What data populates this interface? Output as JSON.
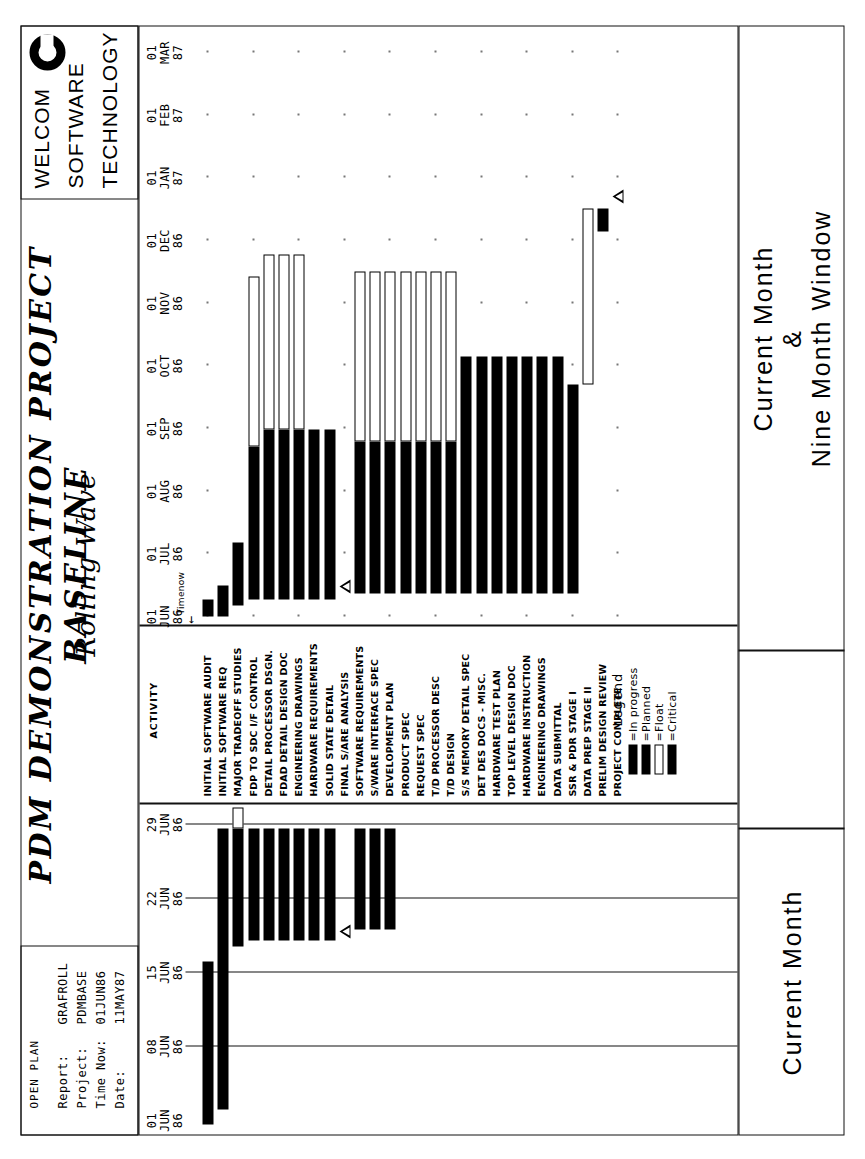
{
  "header": {
    "open_plan": "OPEN PLAN",
    "fields": [
      {
        "label": "Report:",
        "value": "GRAFROLL"
      },
      {
        "label": "Project:",
        "value": "PDMBASE"
      },
      {
        "label": "Time Now:",
        "value": "01JUN86"
      },
      {
        "label": "Date:",
        "value": "11MAY87"
      }
    ],
    "title": "PDM DEMONSTRATION PROJECT BASELINE",
    "subtitle": "Rolling Wave",
    "logo": [
      "WELCOM",
      "SOFTWARE",
      "TECHNOLOGY"
    ]
  },
  "left_scale": {
    "ticks": [
      {
        "day": "01",
        "mon": "JUN",
        "yr": "86"
      },
      {
        "day": "08",
        "mon": "JUN",
        "yr": "86"
      },
      {
        "day": "15",
        "mon": "JUN",
        "yr": "86"
      },
      {
        "day": "22",
        "mon": "JUN",
        "yr": "86"
      },
      {
        "day": "29",
        "mon": "JUN",
        "yr": "86"
      }
    ]
  },
  "right_scale": {
    "ticks": [
      {
        "day": "01",
        "mon": "JUN",
        "yr": "86"
      },
      {
        "day": "01",
        "mon": "JUL",
        "yr": "86"
      },
      {
        "day": "01",
        "mon": "AUG",
        "yr": "86"
      },
      {
        "day": "01",
        "mon": "SEP",
        "yr": "86"
      },
      {
        "day": "01",
        "mon": "OCT",
        "yr": "86"
      },
      {
        "day": "01",
        "mon": "NOV",
        "yr": "86"
      },
      {
        "day": "01",
        "mon": "DEC",
        "yr": "86"
      },
      {
        "day": "01",
        "mon": "JAN",
        "yr": "87"
      },
      {
        "day": "01",
        "mon": "FEB",
        "yr": "87"
      },
      {
        "day": "01",
        "mon": "MAR",
        "yr": "87"
      }
    ]
  },
  "activity_column_header": "ACTIVITY",
  "time_now_marker": "Timenow",
  "activities": [
    "INITIAL SOFTWARE AUDIT",
    "INITIAL SOFTWARE REQ",
    "MAJOR TRADEOFF STUDIES",
    "FDP TO SDC I/F CONTROL",
    "DETAIL PROCESSOR DSGN.",
    "FDAD DETAIL DESIGN DOC",
    "ENGINEERING DRAWINGS",
    "HARDWARE REQUIREMENTS",
    "SOLID STATE DETAIL",
    "FINAL S/ARE ANALYSIS",
    "SOFTWARE REQUIREMENTS",
    "S/WARE INTERFACE SPEC",
    "DEVELOPMENT PLAN",
    "PRODUCT SPEC",
    "REQUEST SPEC",
    "T/D PROCESSOR DESC",
    "T/D DESIGN",
    "S/S MEMORY DETAIL SPEC",
    "DET DES DOCS - MISC.",
    "HARDWARE TEST PLAN",
    "TOP LEVEL DESIGN DOC",
    "HARDWARE INSTRUCTION",
    "ENGINEERING DRAWINGS",
    "DATA SUBMITTAL",
    "SSR & PDR STAGE I",
    "DATA PREP STAGE II",
    "PRELIM DESIGN REVIEW",
    "PROJECT COMPLETE"
  ],
  "legend": {
    "title": "Legend",
    "items": [
      {
        "label": "=In progress",
        "style": "solid"
      },
      {
        "label": "=Planned",
        "style": "solid"
      },
      {
        "label": "=Float",
        "style": "open"
      },
      {
        "label": "=Critical",
        "style": "solid"
      }
    ]
  },
  "footer": {
    "left": "Current Month",
    "right_line1": "Current Month",
    "right_line2": "&",
    "right_line3": "Nine Month Window"
  },
  "chart_data": {
    "type": "bar",
    "xlabel": "",
    "ylabel": "",
    "left_pane_range": [
      "01JUN86",
      "29JUN86"
    ],
    "right_pane_range": [
      "01JUN86",
      "01MAR87"
    ],
    "grid": true,
    "legend_position": "bottom-center",
    "rows": [
      {
        "activity": "INITIAL SOFTWARE AUDIT",
        "left": {
          "start": 0.0,
          "prog": 0.55,
          "float": 0.0
        },
        "right": {
          "start": 0.0,
          "prog": 0.03,
          "plan": 0.0,
          "float": 0.0
        }
      },
      {
        "activity": "INITIAL SOFTWARE REQ",
        "left": {
          "start": 0.05,
          "prog": 0.95,
          "float": 0.0
        },
        "right": {
          "start": 0.0,
          "prog": 0.055,
          "plan": 0.0,
          "float": 0.0
        }
      },
      {
        "activity": "MAJOR TRADEOFF STUDIES",
        "left": {
          "start": 0.6,
          "prog": 0.4,
          "float": 0.07
        },
        "right": {
          "start": 0.02,
          "prog": 0.11,
          "plan": 0.0,
          "float": 0.0
        }
      },
      {
        "activity": "FDP TO SDC I/F CONTROL",
        "left": {
          "start": 0.62,
          "prog": 0.38,
          "float": 0.0
        },
        "right": {
          "start": 0.03,
          "prog": 0.27,
          "plan": 0.0,
          "float": 0.3
        }
      },
      {
        "activity": "DETAIL PROCESSOR DSGN.",
        "left": {
          "start": 0.62,
          "prog": 0.38,
          "float": 0.0
        },
        "right": {
          "start": 0.03,
          "prog": 0.3,
          "plan": 0.0,
          "float": 0.31
        }
      },
      {
        "activity": "FDAD DETAIL DESIGN DOC",
        "left": {
          "start": 0.62,
          "prog": 0.38,
          "float": 0.0
        },
        "right": {
          "start": 0.03,
          "prog": 0.3,
          "plan": 0.0,
          "float": 0.31
        }
      },
      {
        "activity": "ENGINEERING DRAWINGS",
        "left": {
          "start": 0.62,
          "prog": 0.38,
          "float": 0.0
        },
        "right": {
          "start": 0.03,
          "prog": 0.3,
          "plan": 0.0,
          "float": 0.31
        }
      },
      {
        "activity": "HARDWARE REQUIREMENTS",
        "left": {
          "start": 0.62,
          "prog": 0.38,
          "float": 0.0
        },
        "right": {
          "start": 0.03,
          "prog": 0.3,
          "plan": 0.0,
          "float": 0.0
        }
      },
      {
        "activity": "SOLID STATE DETAIL",
        "left": {
          "start": 0.62,
          "prog": 0.38,
          "float": 0.0
        },
        "right": {
          "start": 0.03,
          "prog": 0.3,
          "plan": 0.0,
          "float": 0.0
        }
      },
      {
        "activity": "FINAL S/ARE ANALYSIS",
        "left": {
          "start": 0.63,
          "prog": 0.0,
          "float": 0.0,
          "milestone": true
        },
        "right": {
          "start": 0.04,
          "milestone": true,
          "float": 0.3
        }
      },
      {
        "activity": "SOFTWARE REQUIREMENTS",
        "left": {
          "start": 0.66,
          "prog": 0.34,
          "float": 0.0
        },
        "right": {
          "start": 0.04,
          "prog": 0.27,
          "plan": 0.0,
          "float": 0.3
        }
      },
      {
        "activity": "S/WARE INTERFACE SPEC",
        "left": {
          "start": 0.66,
          "prog": 0.34,
          "float": 0.0
        },
        "right": {
          "start": 0.04,
          "prog": 0.27,
          "plan": 0.0,
          "float": 0.3
        }
      },
      {
        "activity": "DEVELOPMENT PLAN",
        "left": {
          "start": 0.66,
          "prog": 0.34,
          "float": 0.0
        },
        "right": {
          "start": 0.04,
          "prog": 0.27,
          "plan": 0.0,
          "float": 0.3
        }
      },
      {
        "activity": "PRODUCT SPEC",
        "left": null,
        "right": {
          "start": 0.04,
          "prog": 0.27,
          "plan": 0.0,
          "float": 0.3
        }
      },
      {
        "activity": "REQUEST SPEC",
        "left": null,
        "right": {
          "start": 0.04,
          "prog": 0.27,
          "plan": 0.0,
          "float": 0.3
        }
      },
      {
        "activity": "T/D PROCESSOR DESC",
        "left": null,
        "right": {
          "start": 0.04,
          "prog": 0.27,
          "plan": 0.0,
          "float": 0.3
        }
      },
      {
        "activity": "T/D DESIGN",
        "left": null,
        "right": {
          "start": 0.04,
          "prog": 0.27,
          "plan": 0.0,
          "float": 0.3
        }
      },
      {
        "activity": "S/S MEMORY DETAIL SPEC",
        "left": null,
        "right": {
          "start": 0.04,
          "prog": 0.42,
          "plan": 0.0,
          "float": 0.0
        }
      },
      {
        "activity": "DET DES DOCS - MISC.",
        "left": null,
        "right": {
          "start": 0.04,
          "prog": 0.42,
          "plan": 0.0,
          "float": 0.0
        }
      },
      {
        "activity": "HARDWARE TEST PLAN",
        "left": null,
        "right": {
          "start": 0.04,
          "prog": 0.42,
          "plan": 0.0,
          "float": 0.0
        }
      },
      {
        "activity": "TOP LEVEL DESIGN DOC",
        "left": null,
        "right": {
          "start": 0.04,
          "prog": 0.42,
          "plan": 0.0,
          "float": 0.0
        }
      },
      {
        "activity": "HARDWARE INSTRUCTION",
        "left": null,
        "right": {
          "start": 0.04,
          "prog": 0.42,
          "plan": 0.0,
          "float": 0.0
        }
      },
      {
        "activity": "ENGINEERING DRAWINGS",
        "left": null,
        "right": {
          "start": 0.04,
          "prog": 0.42,
          "plan": 0.0,
          "float": 0.0
        }
      },
      {
        "activity": "DATA SUBMITTAL",
        "left": null,
        "right": {
          "start": 0.04,
          "prog": 0.42,
          "plan": 0.0,
          "float": 0.0
        }
      },
      {
        "activity": "SSR & PDR STAGE I",
        "left": null,
        "right": {
          "start": 0.04,
          "prog": 0.37,
          "plan": 0.0,
          "float": 0.0
        }
      },
      {
        "activity": "DATA PREP STAGE II",
        "left": null,
        "right": {
          "start": 0.41,
          "prog": 0.0,
          "plan": 0.0,
          "float": 0.31
        }
      },
      {
        "activity": "PRELIM DESIGN REVIEW",
        "left": null,
        "right": {
          "start": 0.68,
          "prog": 0.04,
          "plan": 0.0,
          "float": 0.0
        }
      },
      {
        "activity": "PROJECT COMPLETE",
        "left": null,
        "right": {
          "start": 0.73,
          "milestone": true
        }
      }
    ]
  }
}
